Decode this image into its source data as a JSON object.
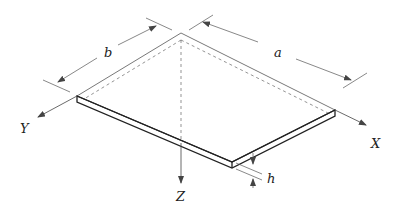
{
  "diagram": {
    "labels": {
      "a": "a",
      "b": "b",
      "h": "h",
      "x_axis": "X",
      "y_axis": "Y",
      "z_axis": "Z"
    },
    "colors": {
      "line": "#333333",
      "thin_line": "#555555",
      "background": "#ffffff"
    }
  }
}
